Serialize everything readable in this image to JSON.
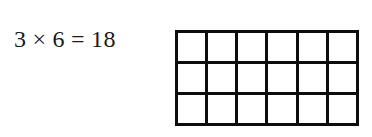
{
  "equation": {
    "left_operand": "3",
    "operator": "×",
    "right_operand": "6",
    "equals": "=",
    "result": "18"
  },
  "grid": {
    "rows": 3,
    "columns": 6,
    "cell_count": 18,
    "line_color": "#0d0d0d",
    "fill_color": "#ffffff"
  }
}
